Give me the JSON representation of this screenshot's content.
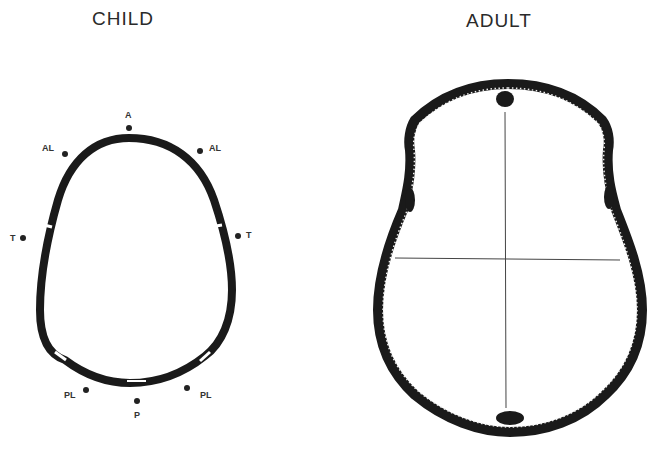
{
  "panels": {
    "child": {
      "title": "CHILD",
      "labels": {
        "anterior": "A",
        "anterolateral_left": "AL",
        "anterolateral_right": "AL",
        "temporal_left": "T",
        "temporal_right": "T",
        "posterolateral_left": "PL",
        "posterolateral_right": "PL",
        "posterior": "P"
      }
    },
    "adult": {
      "title": "ADULT"
    }
  },
  "colors": {
    "bone": "#1a1a1a",
    "line": "#444444",
    "background": "#ffffff"
  }
}
